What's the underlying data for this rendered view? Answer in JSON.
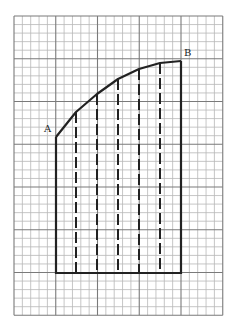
{
  "diagram": {
    "type": "area-under-curve-on-grid",
    "grid": {
      "x0": 14,
      "y0": 16,
      "cols": 25,
      "rows": 35,
      "cell_w": 8.35,
      "cell_h": 8.55,
      "major_every": 5,
      "minor_color": "#b8b8b8",
      "major_color": "#7a7a7a"
    },
    "points": {
      "A": {
        "label": "A",
        "x": 56,
        "y": 137,
        "label_x": 44,
        "label_y": 132
      },
      "B": {
        "label": "B",
        "x": 181,
        "y": 61,
        "label_x": 184,
        "label_y": 56
      }
    },
    "curve": [
      [
        56,
        137
      ],
      [
        76,
        112
      ],
      [
        97,
        94
      ],
      [
        118,
        79
      ],
      [
        139,
        69
      ],
      [
        160,
        63
      ],
      [
        181,
        61
      ]
    ],
    "outline": {
      "left_x": 56,
      "right_x": 181,
      "bottom_y": 273,
      "color": "#222222"
    },
    "dashed_lines": [
      {
        "x": 76,
        "top": 112
      },
      {
        "x": 97,
        "top": 94
      },
      {
        "x": 118,
        "top": 79
      },
      {
        "x": 139,
        "top": 69
      },
      {
        "x": 160,
        "top": 63
      }
    ]
  }
}
